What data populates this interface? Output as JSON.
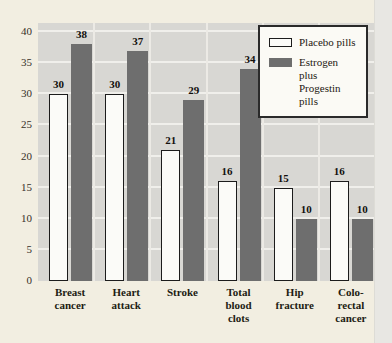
{
  "chart_data": {
    "type": "bar",
    "title": "",
    "xlabel": "",
    "ylabel": "",
    "categories": [
      "Breast cancer",
      "Heart attack",
      "Stroke",
      "Total blood clots",
      "Hip fracture",
      "Colo-rectal cancer"
    ],
    "category_label_lines": [
      [
        "Breast",
        "cancer"
      ],
      [
        "Heart",
        "attack"
      ],
      [
        "Stroke"
      ],
      [
        "Total",
        "blood",
        "clots"
      ],
      [
        "Hip",
        "fracture"
      ],
      [
        "Colo-",
        "rectal",
        "cancer"
      ]
    ],
    "series": [
      {
        "name": "Placebo pills",
        "values": [
          30,
          30,
          21,
          16,
          15,
          16
        ],
        "color": "#fbfbf8",
        "border_color": "#1c1c1c"
      },
      {
        "name": "Estrogen plus Progestin pills",
        "values": [
          38,
          37,
          29,
          34,
          10,
          10
        ],
        "color": "#6e6e6e",
        "border_color": "#6e6e6e"
      }
    ],
    "ylim": [
      0,
      40
    ],
    "ytick_step": 5,
    "yticks": [
      0,
      5,
      10,
      15,
      20,
      25,
      30,
      35,
      40
    ],
    "grid": true,
    "gridline_color": "#f0efeb",
    "plot_background": "#d8d7d3",
    "page_background": "#f2eee1",
    "legend_position": "top-right",
    "bar_value_labels_shown": true
  },
  "legend": {
    "items": [
      {
        "lines": [
          "Placebo pills"
        ],
        "swatch": "placebo"
      },
      {
        "lines": [
          "Estrogen plus",
          "Progestin pills"
        ],
        "swatch": "estrogen"
      }
    ]
  }
}
